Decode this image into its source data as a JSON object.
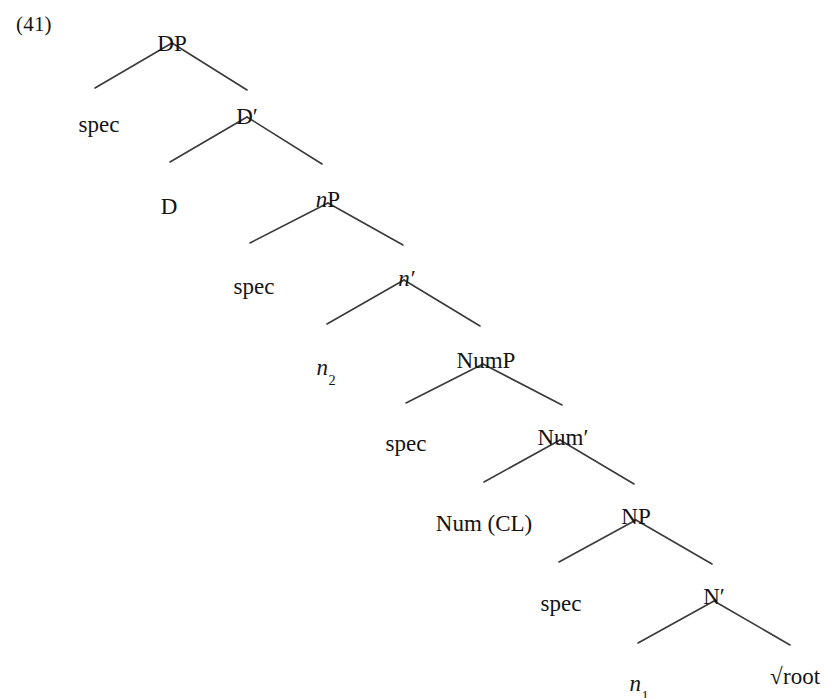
{
  "figure": {
    "example_number": "(41)",
    "width": 840,
    "height": 698,
    "line_color": "#3a3a3a",
    "text_color": "#141414",
    "background_color": "#ffffff"
  },
  "nodes": {
    "dp": {
      "label": "DP",
      "x": 172,
      "y": 32
    },
    "spec_dp": {
      "label": "spec",
      "x": 99,
      "y": 113
    },
    "dbar": {
      "label": "D",
      "prime": "′",
      "x": 247,
      "y": 105
    },
    "d": {
      "label": "D",
      "x": 169,
      "y": 195
    },
    "np_small": {
      "label": "n",
      "tail": "P",
      "x": 328,
      "y": 188
    },
    "spec_n": {
      "label": "spec",
      "x": 254,
      "y": 275
    },
    "nbar": {
      "label": "n",
      "prime": "′",
      "x": 407,
      "y": 267
    },
    "n2": {
      "label": "n",
      "sub": "2",
      "x": 326,
      "y": 356
    },
    "nump": {
      "label": "NumP",
      "x": 486,
      "y": 349
    },
    "spec_num": {
      "label": "spec",
      "x": 406,
      "y": 432
    },
    "numbar": {
      "label": "Num",
      "prime": "′",
      "x": 563,
      "y": 426
    },
    "num_cl": {
      "label": "Num (CL)",
      "x": 484,
      "y": 512
    },
    "np": {
      "label": "NP",
      "x": 636,
      "y": 505
    },
    "spec_np": {
      "label": "spec",
      "x": 561,
      "y": 592
    },
    "nbar_cap": {
      "label": "N",
      "prime": "′",
      "x": 714,
      "y": 585
    },
    "n1": {
      "label": "n",
      "sub": "1",
      "x": 639,
      "y": 672
    },
    "root": {
      "radical": "√",
      "label": "root",
      "x": 795,
      "y": 665
    }
  },
  "branches": [
    {
      "parent": "dp",
      "apex_x": 172,
      "apex_y": 43,
      "left_x": 95,
      "left_y": 88,
      "right_x": 247,
      "right_y": 90
    },
    {
      "parent": "dbar",
      "apex_x": 247,
      "apex_y": 117,
      "left_x": 170,
      "left_y": 162,
      "right_x": 322,
      "right_y": 164
    },
    {
      "parent": "np_small",
      "apex_x": 328,
      "apex_y": 203,
      "left_x": 250,
      "left_y": 243,
      "right_x": 403,
      "right_y": 245
    },
    {
      "parent": "nbar",
      "apex_x": 404,
      "apex_y": 280,
      "left_x": 327,
      "left_y": 324,
      "right_x": 480,
      "right_y": 326
    },
    {
      "parent": "nump",
      "apex_x": 483,
      "apex_y": 364,
      "left_x": 406,
      "left_y": 403,
      "right_x": 562,
      "right_y": 405
    },
    {
      "parent": "numbar",
      "apex_x": 560,
      "apex_y": 440,
      "left_x": 484,
      "left_y": 482,
      "right_x": 634,
      "right_y": 484
    },
    {
      "parent": "np",
      "apex_x": 636,
      "apex_y": 520,
      "left_x": 559,
      "left_y": 562,
      "right_x": 712,
      "right_y": 564
    },
    {
      "parent": "nbar_cap",
      "apex_x": 714,
      "apex_y": 601,
      "left_x": 638,
      "left_y": 643,
      "right_x": 790,
      "right_y": 645
    }
  ]
}
